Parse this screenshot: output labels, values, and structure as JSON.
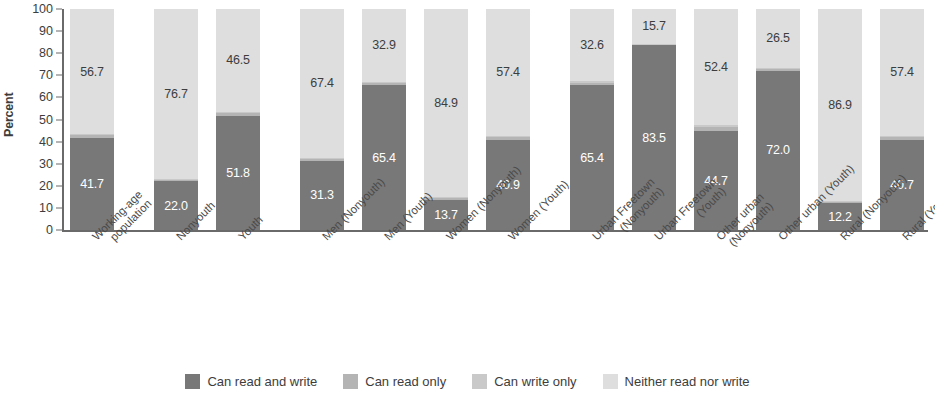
{
  "chart_data": {
    "type": "bar",
    "subtype": "stacked-bar-100",
    "title": "",
    "xlabel": "",
    "ylabel": "Percent",
    "ylim": [
      0,
      100
    ],
    "yticks": [
      0,
      10,
      20,
      30,
      40,
      50,
      60,
      70,
      80,
      90,
      100
    ],
    "grid": false,
    "legend_position": "bottom",
    "categories": [
      "Working-age population",
      "Nonyouth",
      "Youth",
      "Men (Nonyouth)",
      "Men (Youth)",
      "Women (Nonyouth)",
      "Women (Youth)",
      "Urban Freetown (Nonyouth)",
      "Urban Freetown (Youth)",
      "Other urban (Nonyouth)",
      "Other urban (Youth)",
      "Rural (Nonyouth)",
      "Rural (Youth)"
    ],
    "category_lines": [
      [
        "Working-age",
        "population"
      ],
      [
        "Nonyouth"
      ],
      [
        "Youth"
      ],
      [
        "Men (Nonyouth)"
      ],
      [
        "Men (Youth)"
      ],
      [
        "Women (Nonyouth)"
      ],
      [
        "Women (Youth)"
      ],
      [
        "Urban Freetown",
        "(Nonyouth)"
      ],
      [
        "Urban Freetown",
        "(Youth)"
      ],
      [
        "Other urban",
        "(Nonyouth)"
      ],
      [
        "Other urban (Youth)"
      ],
      [
        "Rural (Nonyouth)"
      ],
      [
        "Rural (Youth)"
      ]
    ],
    "group_breaks_after": [
      0,
      2,
      6
    ],
    "series": [
      {
        "name": "Can read and write",
        "key": "rw",
        "color": "#787878",
        "values": [
          41.7,
          22.0,
          51.8,
          31.3,
          65.4,
          13.7,
          40.9,
          65.4,
          83.5,
          44.7,
          72.0,
          12.2,
          40.7
        ],
        "labels": [
          "41.7",
          "22.0",
          "51.8",
          "31.3",
          "65.4",
          "13.7",
          "40.9",
          "65.4",
          "83.5",
          "44.7",
          "72.0",
          "12.2",
          "40.7"
        ]
      },
      {
        "name": "Can read only",
        "key": "ro",
        "color": "#b4b4b4",
        "values": [
          1.1,
          0.8,
          1.3,
          0.9,
          1.2,
          0.8,
          1.2,
          1.3,
          0.5,
          1.8,
          1.0,
          0.6,
          1.3
        ],
        "labels": [
          "",
          "",
          "",
          "",
          "",
          "",
          "",
          "",
          "",
          "",
          "",
          "",
          ""
        ]
      },
      {
        "name": "Can write only",
        "key": "wo",
        "color": "#c9c9c9",
        "values": [
          0.5,
          0.5,
          0.4,
          0.4,
          0.5,
          0.6,
          0.5,
          0.7,
          0.3,
          1.1,
          0.5,
          0.3,
          0.6
        ],
        "labels": [
          "",
          "",
          "",
          "",
          "",
          "",
          "",
          "",
          "",
          "",
          "",
          "",
          ""
        ]
      },
      {
        "name": "Neither read nor write",
        "key": "nn",
        "color": "#dedede",
        "values": [
          56.7,
          76.7,
          46.5,
          67.4,
          32.9,
          84.9,
          57.4,
          32.6,
          15.7,
          52.4,
          26.5,
          86.9,
          57.4
        ],
        "labels": [
          "56.7",
          "76.7",
          "46.5",
          "67.4",
          "32.9",
          "84.9",
          "57.4",
          "32.6",
          "15.7",
          "52.4",
          "26.5",
          "86.9",
          "57.4"
        ]
      }
    ]
  },
  "axis": {
    "y_title": "Percent",
    "y_ticks": [
      "100",
      "90",
      "80",
      "70",
      "60",
      "50",
      "40",
      "30",
      "20",
      "10",
      "0"
    ]
  },
  "legend": {
    "items": [
      {
        "label": "Can read and write",
        "color": "#787878"
      },
      {
        "label": "Can read only",
        "color": "#b4b4b4"
      },
      {
        "label": "Can write only",
        "color": "#c9c9c9"
      },
      {
        "label": "Neither read nor write",
        "color": "#dedede"
      }
    ]
  }
}
